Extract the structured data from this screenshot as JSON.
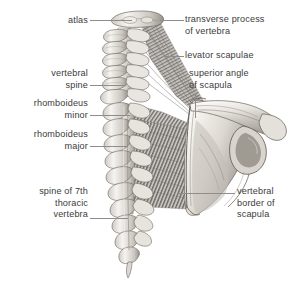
{
  "figure": {
    "width": 292,
    "height": 291,
    "background_color": "#ffffff",
    "label_color": "#3b3b3b",
    "leader_color": "#8d8d8d",
    "bone_light": "#f2f0ec",
    "bone_mid": "#cfcac4",
    "bone_shadow": "#8f8a84",
    "muscle_light": "#d8d6d2",
    "muscle_dark": "#6f6d6a"
  },
  "labels": {
    "atlas": {
      "text": "atlas",
      "align": "right",
      "x": 20,
      "y": 15,
      "width": 68
    },
    "vertebral_spine": {
      "text": "vertebral\nspine",
      "align": "right",
      "x": 8,
      "y": 68,
      "width": 80
    },
    "rhomboideus_minor": {
      "text": "rhomboideus\nminor",
      "align": "right",
      "x": 4,
      "y": 98,
      "width": 84
    },
    "rhomboideus_major": {
      "text": "rhomboideus\nmajor",
      "align": "right",
      "x": 4,
      "y": 129,
      "width": 84
    },
    "spine_of_7th_thoracic_vertebra": {
      "text": "spine of 7th\nthoracic\nvertebra",
      "align": "right",
      "x": 10,
      "y": 186,
      "width": 78
    },
    "transverse_process_of_vertebra": {
      "text": "transverse process\nof vertebra",
      "align": "left",
      "x": 185,
      "y": 14,
      "width": 104
    },
    "levator_scapulae": {
      "text": "levator scapulae",
      "align": "left",
      "x": 185,
      "y": 50,
      "width": 104
    },
    "superior_angle_of_scapula": {
      "text": "superior angle\nof scapula",
      "align": "left",
      "x": 189,
      "y": 68,
      "width": 100
    },
    "vertebral_border_of_scapula": {
      "text": "vertebral\nborder of\nscapula",
      "align": "left",
      "x": 237,
      "y": 186,
      "width": 55
    }
  },
  "leaders": [
    {
      "name": "leader-atlas",
      "orient": "h",
      "x": 90,
      "y": 20,
      "length": 42
    },
    {
      "name": "leader-vertebral-spine",
      "orient": "h",
      "x": 90,
      "y": 85,
      "length": 36
    },
    {
      "name": "leader-rhomboideus-minor",
      "orient": "h",
      "x": 90,
      "y": 115,
      "length": 40
    },
    {
      "name": "leader-rhomboideus-major",
      "orient": "h",
      "x": 90,
      "y": 146,
      "length": 38
    },
    {
      "name": "leader-spine-7th-thoracic",
      "orient": "h",
      "x": 90,
      "y": 218,
      "length": 38
    },
    {
      "name": "leader-transverse-process",
      "orient": "h",
      "x": 160,
      "y": 20,
      "length": 24
    },
    {
      "name": "leader-levator-scapulae",
      "orient": "h",
      "x": 162,
      "y": 56,
      "length": 22
    },
    {
      "name": "leader-superior-angle",
      "orient": "v",
      "x": 195,
      "y": 93,
      "length": 25
    },
    {
      "name": "leader-vertebral-border",
      "orient": "h",
      "x": 178,
      "y": 193,
      "length": 57
    }
  ],
  "anatomy_parts": [
    {
      "name": "atlas-vertebra",
      "label": "atlas (C1)"
    },
    {
      "name": "cervical-vertebrae",
      "label": "cervical vertebrae"
    },
    {
      "name": "thoracic-vertebrae",
      "label": "thoracic vertebrae"
    },
    {
      "name": "levator-scapulae-muscle",
      "label": "levator scapulae"
    },
    {
      "name": "rhomboideus-minor-muscle",
      "label": "rhomboideus minor"
    },
    {
      "name": "rhomboideus-major-muscle",
      "label": "rhomboideus major"
    },
    {
      "name": "scapula-bone",
      "label": "scapula"
    },
    {
      "name": "spine-of-scapula",
      "label": "spine of scapula"
    },
    {
      "name": "acromion",
      "label": "acromion"
    },
    {
      "name": "glenoid-cavity",
      "label": "glenoid cavity"
    }
  ]
}
